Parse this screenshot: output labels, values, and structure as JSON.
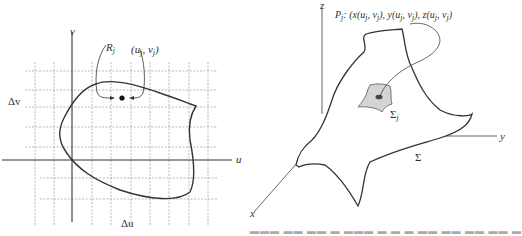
{
  "left_figure": {
    "axis_u_label": "u",
    "axis_v_label": "v",
    "delta_u_label": "Δu",
    "delta_v_label": "Δv",
    "region_label": "R",
    "region_sub": "j",
    "point_label": "(u",
    "point_sub1": "j",
    "point_mid": ", v",
    "point_sub2": "j",
    "point_end": ")"
  },
  "right_figure": {
    "axis_x_label": "x",
    "axis_y_label": "y",
    "axis_z_label": "z",
    "point_label_prefix": "P",
    "point_label_sub": "j",
    "point_label_text": ": (x(u",
    "point_label_full": "P_j: (x(u_j, v_j), y(u_j, v_j), z(u_j, v_j)",
    "surface_label": "Σ",
    "patch_label": "Σ",
    "patch_sub": "j"
  },
  "colors": {
    "line": "#333333",
    "grid": "#8a8a8a",
    "patch_fill": "#d4d4d4"
  }
}
